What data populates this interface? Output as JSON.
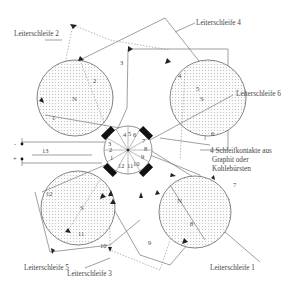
{
  "diagram": {
    "type": "multipole generator with slip-ring commutator",
    "loop_labels": [
      {
        "id": "1",
        "text": "Leiterschleife 1"
      },
      {
        "id": "2",
        "text": "Leiterschleife 2"
      },
      {
        "id": "3",
        "text": "Leiterschleife 3"
      },
      {
        "id": "4",
        "text": "Leiterschleife 4"
      },
      {
        "id": "5",
        "text": "Leiterschleife 5"
      },
      {
        "id": "6",
        "text": "Leiterschleife 6"
      }
    ],
    "brush_note": {
      "line1": "4 Schleifkontakte aus",
      "line2": "Graphit oder",
      "line3": "Kohlebürsten"
    },
    "terminals": {
      "minus": "-",
      "plus": "+"
    },
    "poles": {
      "top_left": "N",
      "top_right": "S",
      "bottom_left": "S",
      "bottom_right": "N"
    },
    "wire_numbers": [
      "1",
      "2",
      "3",
      "4",
      "5",
      "6",
      "7",
      "8",
      "9",
      "10",
      "11",
      "12",
      "13"
    ],
    "commutator_numbers": [
      "1",
      "2",
      "3",
      "4",
      "5",
      "6",
      "7",
      "8",
      "9",
      "10",
      "11",
      "12"
    ]
  }
}
